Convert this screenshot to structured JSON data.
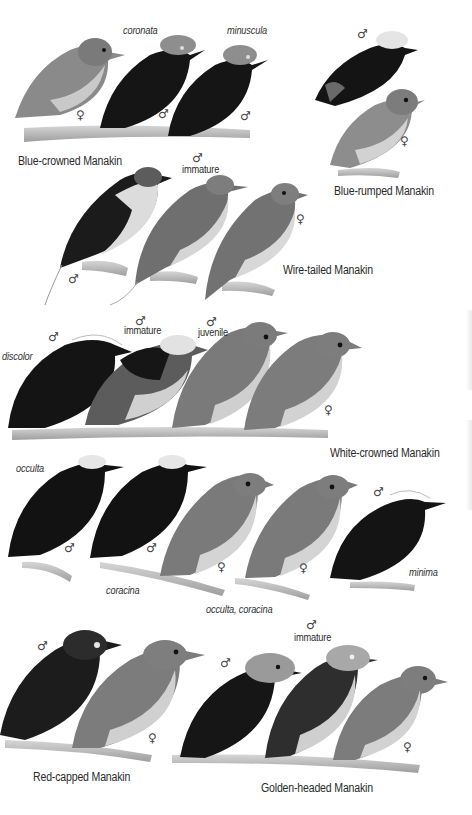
{
  "plate": {
    "species": [
      {
        "name": "Blue-crowned Manakin",
        "figures": [
          {
            "sex": "♀",
            "subspecies": ""
          },
          {
            "sex": "♂",
            "subspecies": "coronata"
          },
          {
            "sex": "♂",
            "subspecies": "minuscula"
          }
        ]
      },
      {
        "name": "Blue-rumped Manakin",
        "figures": [
          {
            "sex": "♂"
          },
          {
            "sex": "♀"
          }
        ]
      },
      {
        "name": "Wire-tailed Manakin",
        "figures": [
          {
            "sex": "♂",
            "age": ""
          },
          {
            "sex": "♂",
            "age": "immature"
          },
          {
            "sex": "♀"
          }
        ]
      },
      {
        "name": "White-crowned Manakin",
        "figures": [
          {
            "sex": "♂",
            "subspecies": "discolor"
          },
          {
            "sex": "♂",
            "age": "immature"
          },
          {
            "sex": "♂",
            "age": "juvenile"
          },
          {
            "sex": "♀"
          },
          {
            "sex": "♂",
            "subspecies": "occulta"
          },
          {
            "sex": "♂",
            "subspecies": "coracina"
          },
          {
            "sex": "♀",
            "subspecies": "occulta, coracina"
          },
          {
            "sex": "♀"
          },
          {
            "sex": "♂",
            "subspecies": "minima"
          }
        ]
      },
      {
        "name": "Red-capped Manakin",
        "figures": [
          {
            "sex": "♂"
          },
          {
            "sex": "♀"
          }
        ]
      },
      {
        "name": "Golden-headed Manakin",
        "figures": [
          {
            "sex": "♂"
          },
          {
            "sex": "♂",
            "age": "immature"
          },
          {
            "sex": "♀"
          }
        ]
      }
    ]
  },
  "labels": {
    "male": "♂",
    "female": "♀",
    "coronata": "coronata",
    "minuscula": "minuscula",
    "blue_crowned": "Blue-crowned Manakin",
    "blue_rumped": "Blue-rumped Manakin",
    "immature": "immature",
    "juvenile": "juvenile",
    "wire_tailed": "Wire-tailed Manakin",
    "discolor": "discolor",
    "white_crowned": "White-crowned Manakin",
    "occulta": "occulta",
    "coracina": "coracina",
    "occulta_coracina": "occulta, coracina",
    "minima": "minima",
    "red_capped": "Red-capped Manakin",
    "golden_headed": "Golden-headed Manakin"
  }
}
